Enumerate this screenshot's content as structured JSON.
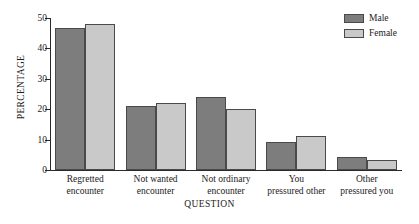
{
  "chart_data": {
    "type": "bar",
    "title": "",
    "xlabel": "QUESTION",
    "ylabel": "PERCENTAGE",
    "categories": [
      "Regretted encounter",
      "Not wanted encounter",
      "Not ordinary encounter",
      "You pressured other",
      "Other pressured you"
    ],
    "category_lines": [
      [
        "Regretted",
        "encounter"
      ],
      [
        "Not wanted",
        "encounter"
      ],
      [
        "Not ordinary",
        "encounter"
      ],
      [
        "You",
        "pressured other"
      ],
      [
        "Other",
        "pressured you"
      ]
    ],
    "series": [
      {
        "name": "Male",
        "color": "#7d7d7d",
        "values": [
          46.7,
          21.0,
          24.0,
          9.3,
          4.2
        ]
      },
      {
        "name": "Female",
        "color": "#c9c9c9",
        "values": [
          48.0,
          22.0,
          20.0,
          11.3,
          3.4
        ]
      }
    ],
    "ylim": [
      0,
      50
    ],
    "yticks": [
      0,
      10,
      20,
      30,
      40,
      50
    ],
    "ytick_labels": [
      "0",
      "10",
      "20",
      "30",
      "40",
      "50"
    ],
    "grid": false,
    "legend_position": "top-right"
  },
  "legend": {
    "items": [
      {
        "label": "Male"
      },
      {
        "label": "Female"
      }
    ]
  }
}
